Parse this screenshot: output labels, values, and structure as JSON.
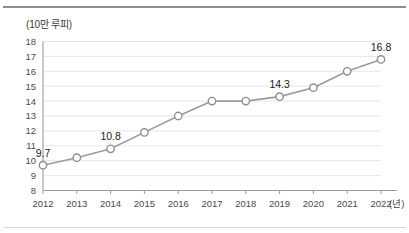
{
  "chart_data": {
    "type": "line",
    "title": "",
    "subtitle": "",
    "xlabel": "(년)",
    "ylabel": "(10만 루피)",
    "categories": [
      "2012",
      "2013",
      "2014",
      "2015",
      "2016",
      "2017",
      "2018",
      "2019",
      "2020",
      "2021",
      "2022"
    ],
    "values": [
      9.7,
      10.2,
      10.8,
      11.9,
      13.0,
      14.0,
      14.0,
      14.3,
      14.9,
      16.0,
      16.8
    ],
    "point_labels": [
      "9.7",
      "",
      "10.8",
      "",
      "",
      "",
      "",
      "14.3",
      "",
      "",
      "16.8"
    ],
    "labeled_points": [
      {
        "category": "2012",
        "value": 9.7,
        "label": "9.7"
      },
      {
        "category": "2014",
        "value": 10.8,
        "label": "10.8"
      },
      {
        "category": "2019",
        "value": 14.3,
        "label": "14.3"
      },
      {
        "category": "2022",
        "value": 16.8,
        "label": "16.8"
      }
    ],
    "ylim": [
      8,
      18
    ],
    "ytick_labels": [
      "18",
      "17",
      "16",
      "15",
      "14",
      "13",
      "12",
      "11",
      "10",
      "9",
      "8"
    ],
    "ytick_step": 1,
    "grid": true,
    "grid_axis": "y",
    "legend": false,
    "legend_position": "none",
    "marker": "open-circle",
    "colors": {
      "line": "#9b9b9b",
      "marker_fill": "#ffffff",
      "marker_stroke": "#8f8f8f",
      "grid": "#e6e6e6",
      "axis": "#9a9a9a",
      "text": "#4a4a4a",
      "label_text": "#1a1a1a",
      "top_rule": "#8d8d8d",
      "bottom_rule": "#d8d8d8",
      "background": "#ffffff"
    }
  }
}
